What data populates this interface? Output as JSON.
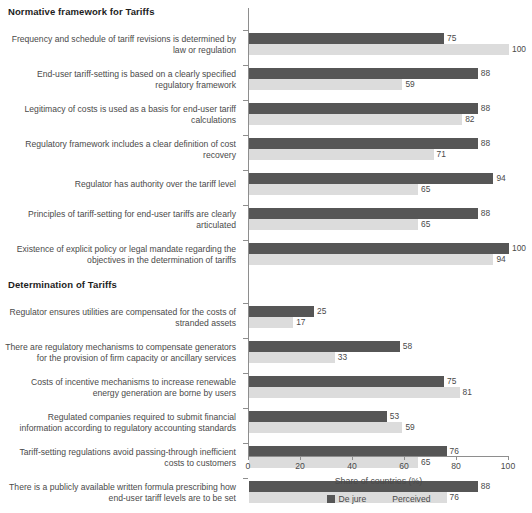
{
  "chart_data": {
    "type": "bar",
    "orientation": "horizontal",
    "title": "",
    "xlabel": "Share of countries (%)",
    "ylabel": "",
    "xlim": [
      0,
      100
    ],
    "xticks": [
      0,
      20,
      40,
      60,
      80,
      100
    ],
    "grid": false,
    "legend_position": "bottom-center",
    "series": [
      {
        "name": "De jure",
        "color": "#565656"
      },
      {
        "name": "Perceived",
        "color": "#dcdcdc"
      }
    ],
    "sections": [
      {
        "header": "Normative framework for Tariffs",
        "items": [
          {
            "category": "Frequency and schedule of tariff revisions is determined by law or regulation",
            "de_jure": 75,
            "perceived": 100
          },
          {
            "category": "End-user tariff-setting is based on a clearly specified regulatory framework",
            "de_jure": 88,
            "perceived": 59
          },
          {
            "category": "Legitimacy of costs is used as a basis for end-user tariff calculations",
            "de_jure": 88,
            "perceived": 82
          },
          {
            "category": "Regulatory framework includes a clear definition of cost recovery",
            "de_jure": 88,
            "perceived": 71
          },
          {
            "category": "Regulator has authority over the tariff level",
            "de_jure": 94,
            "perceived": 65
          },
          {
            "category": "Principles of tariff-setting for end-user tariffs are clearly articulated",
            "de_jure": 88,
            "perceived": 65
          },
          {
            "category": "Existence of explicit policy or legal mandate regarding the objectives in the determination of tariffs",
            "de_jure": 100,
            "perceived": 94
          }
        ]
      },
      {
        "header": "Determination of Tariffs",
        "items": [
          {
            "category": "Regulator ensures utilities are compensated for the costs of stranded assets",
            "de_jure": 25,
            "perceived": 17
          },
          {
            "category": "There are regulatory mechanisms to compensate generators for the provision of firm capacity or ancillary services",
            "de_jure": 58,
            "perceived": 33
          },
          {
            "category": "Costs of incentive mechanisms to increase renewable energy generation are borne by users",
            "de_jure": 75,
            "perceived": 81
          },
          {
            "category": "Regulated companies required to submit financial information according to regulatory accounting standards",
            "de_jure": 53,
            "perceived": 59
          },
          {
            "category": "Tariff-setting regulations avoid passing-through inefficient costs to customers",
            "de_jure": 76,
            "perceived": 65
          },
          {
            "category": "There is a publicly available written formula prescribing how end-user tariff levels are to be set",
            "de_jure": 88,
            "perceived": 76
          }
        ]
      }
    ]
  },
  "colors": {
    "de_jure": "#565656",
    "perceived": "#dcdcdc",
    "axis": "#8e8e8e",
    "text": "#4a4a4a",
    "header_text": "#1d1d1d",
    "background": "#ffffff"
  }
}
